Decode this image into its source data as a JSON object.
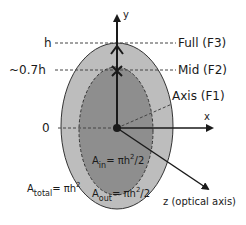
{
  "diagram": {
    "axes": {
      "y_label": "y",
      "x_label": "x",
      "z_label": "z (optical axis)"
    },
    "levels": [
      {
        "left_label": "h",
        "right_label": "Full (F3)"
      },
      {
        "left_label": "~0.7h",
        "right_label": "Mid (F2)"
      },
      {
        "left_label": "0",
        "right_label": ""
      }
    ],
    "axis_label": "Axis (F1)",
    "areas": {
      "total": {
        "symbol": "A",
        "subscript": "total",
        "eq": "= πh",
        "exp": "2",
        "tail": ""
      },
      "inner": {
        "symbol": "A",
        "subscript": "in",
        "eq": "= πh",
        "exp": "2",
        "tail": "/2"
      },
      "outer": {
        "symbol": "A",
        "subscript": "out",
        "eq": "= πh",
        "exp": "2",
        "tail": "/2"
      }
    },
    "colors": {
      "outer_fill": "#bdbdbd",
      "inner_fill": "#8e8e8e",
      "stroke": "#333333"
    }
  }
}
